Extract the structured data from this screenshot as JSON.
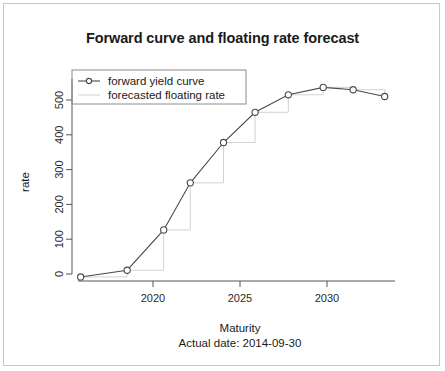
{
  "chart_data": {
    "type": "line",
    "title": "Forward curve and floating rate forecast",
    "xlabel": "Maturity",
    "ylabel": "rate",
    "annotation": "Actual date:  2014-09-30",
    "xlim": [
      2014.6,
      2033.8
    ],
    "ylim": [
      -30,
      580
    ],
    "xticks": [
      2020,
      2025,
      2030
    ],
    "xticklabels": [
      "2020",
      "2025",
      "2030"
    ],
    "yticks": [
      0,
      100,
      200,
      300,
      400,
      500
    ],
    "yticklabels": [
      "0",
      "100",
      "200",
      "300",
      "400",
      "500"
    ],
    "grid": false,
    "legend_position": "top-left",
    "x": [
      2015.0,
      2017.8,
      2020.0,
      2021.6,
      2023.6,
      2025.5,
      2027.5,
      2029.6,
      2031.4,
      2033.3
    ],
    "series": [
      {
        "name": "forward yield curve",
        "marker": "open-circle",
        "color": "#4a4a4a",
        "values": [
          -12,
          8,
          128,
          268,
          388,
          478,
          530,
          552,
          545,
          525
        ]
      },
      {
        "name": "forecasted floating rate",
        "type": "step",
        "color": "#d2d2d2",
        "values": [
          -12,
          8,
          128,
          268,
          388,
          478,
          530,
          552,
          545,
          525
        ]
      }
    ]
  },
  "legend": {
    "entries": [
      {
        "label": "forward yield curve"
      },
      {
        "label": "forecasted floating rate"
      }
    ]
  }
}
